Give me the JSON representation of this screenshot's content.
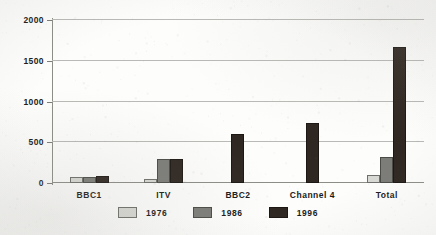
{
  "chart_data": {
    "type": "bar",
    "title": "",
    "subtitle": "",
    "xlabel": "",
    "ylabel": "",
    "categories": [
      "BBC1",
      "ITV",
      "BBC2",
      "Channel 4",
      "Total"
    ],
    "series": [
      {
        "name": "1976",
        "color": "#d8d8d4",
        "values": [
          50,
          25,
          0,
          0,
          70
        ]
      },
      {
        "name": "1986",
        "color": "#7c7c78",
        "values": [
          55,
          265,
          0,
          0,
          300
        ]
      },
      {
        "name": "1996",
        "color": "#2f2721",
        "values": [
          65,
          265,
          580,
          710,
          1640
        ]
      }
    ],
    "ylim": [
      0,
      2000
    ],
    "yticks": [
      0,
      500,
      1000,
      1500,
      2000
    ],
    "ytick_labels": [
      "0",
      "500",
      "1000",
      "1500",
      "2000"
    ],
    "grid": true,
    "legend_position": "bottom",
    "annotations": []
  },
  "legend": {
    "items": [
      {
        "label": "1976"
      },
      {
        "label": "1986"
      },
      {
        "label": "1996"
      }
    ]
  }
}
